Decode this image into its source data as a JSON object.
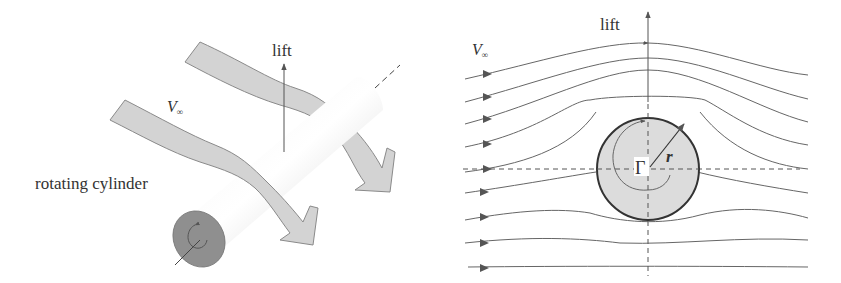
{
  "left_panel": {
    "lift_label": "lift",
    "velocity_label": "V",
    "velocity_subscript": "∞",
    "cylinder_label": "rotating cylinder"
  },
  "right_panel": {
    "lift_label": "lift",
    "velocity_label": "V",
    "velocity_subscript": "∞",
    "circulation_label": "Γ",
    "radius_label": "r"
  },
  "colors": {
    "stream_band_fill": "#d3d3d3",
    "stream_band_stroke": "#8a8a8a",
    "cylinder_end_cap": "#8f8f8f",
    "circle_fill": "#dcdcdc",
    "line": "#555555"
  }
}
